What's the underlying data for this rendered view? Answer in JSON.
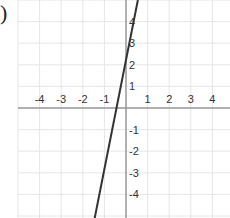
{
  "label": ")",
  "chart_data": {
    "type": "line",
    "title": "",
    "xlabel": "",
    "ylabel": "",
    "xlim": [
      -5,
      5
    ],
    "ylim": [
      -5,
      5
    ],
    "grid": true,
    "x_ticks": [
      "-4",
      "-3",
      "-2",
      "-1",
      "1",
      "2",
      "3",
      "4"
    ],
    "y_ticks": [
      "4",
      "3",
      "2",
      "1",
      "-1",
      "-2",
      "-3",
      "-4"
    ],
    "series": [
      {
        "name": "line",
        "color": "#333333",
        "points": [
          [
            -1.45,
            -5.1
          ],
          [
            0.55,
            5.0
          ]
        ],
        "approx_equation": "y = 5x + 2.3"
      }
    ],
    "colors": {
      "grid": "#e6e6e6",
      "axis": "#9a9a9a",
      "line": "#333333"
    }
  }
}
